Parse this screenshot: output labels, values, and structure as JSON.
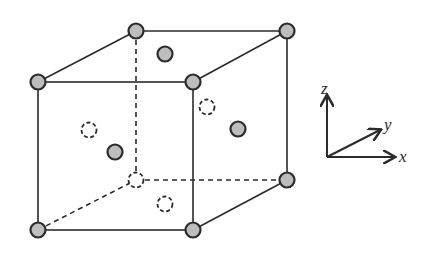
{
  "figure": {
    "colors": {
      "edge": "#2b2b2b",
      "atom_fill": "#bdbdbd",
      "atom_stroke": "#2b2b2b",
      "background": "#ffffff"
    },
    "cube": {
      "front": {
        "tl": [
          38,
          82
        ],
        "tr": [
          193,
          82
        ],
        "bl": [
          38,
          230
        ],
        "br": [
          193,
          230
        ]
      },
      "back": {
        "tl": [
          136,
          31
        ],
        "tr": [
          287,
          31
        ],
        "bl": [
          136,
          180
        ],
        "br": [
          287,
          180
        ]
      }
    },
    "corner_atoms": [
      {
        "name": "front-top-left",
        "x": 38,
        "y": 82,
        "style": "filled"
      },
      {
        "name": "front-top-right",
        "x": 193,
        "y": 82,
        "style": "filled"
      },
      {
        "name": "front-bottom-left",
        "x": 38,
        "y": 230,
        "style": "filled"
      },
      {
        "name": "front-bottom-right",
        "x": 193,
        "y": 230,
        "style": "filled"
      },
      {
        "name": "back-top-left",
        "x": 136,
        "y": 31,
        "style": "filled"
      },
      {
        "name": "back-top-right",
        "x": 287,
        "y": 31,
        "style": "filled"
      },
      {
        "name": "back-bottom-right",
        "x": 287,
        "y": 180,
        "style": "filled"
      },
      {
        "name": "back-bottom-left",
        "x": 136,
        "y": 180,
        "style": "dashed"
      }
    ],
    "face_atoms": [
      {
        "name": "top-face",
        "x": 165,
        "y": 54,
        "style": "filled"
      },
      {
        "name": "right-face",
        "x": 238,
        "y": 129,
        "style": "filled"
      },
      {
        "name": "front-face",
        "x": 115,
        "y": 152,
        "style": "filled"
      },
      {
        "name": "left-face",
        "x": 89,
        "y": 130,
        "style": "dashed"
      },
      {
        "name": "back-face",
        "x": 207,
        "y": 107,
        "style": "dashed"
      },
      {
        "name": "bottom-face",
        "x": 165,
        "y": 204,
        "style": "dashed"
      }
    ],
    "axes": {
      "origin": [
        327,
        157
      ],
      "z": {
        "label": "z",
        "end": [
          327,
          96
        ]
      },
      "y": {
        "label": "y",
        "end": [
          380,
          130
        ]
      },
      "x": {
        "label": "x",
        "end": [
          394,
          157
        ]
      }
    }
  }
}
